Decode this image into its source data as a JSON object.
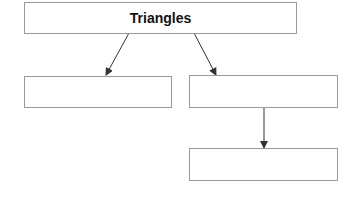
{
  "diagram": {
    "title_box": {
      "label": "Triangles"
    },
    "left_box": {
      "label": ""
    },
    "right_box": {
      "label": ""
    },
    "bottom_box": {
      "label": ""
    },
    "colors": {
      "border": "#9a9a9a",
      "arrow": "#333333",
      "text": "#111111"
    }
  }
}
